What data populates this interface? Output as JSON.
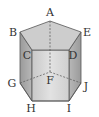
{
  "figure": {
    "vertices": {
      "A": {
        "label": "A",
        "x": 50,
        "y": 21,
        "lx": 50,
        "ly": 16
      },
      "B": {
        "label": "B",
        "x": 20,
        "y": 32,
        "lx": 13,
        "ly": 36
      },
      "C": {
        "label": "C",
        "x": 32,
        "y": 50,
        "lx": 26,
        "ly": 59
      },
      "D": {
        "label": "D",
        "x": 69,
        "y": 50,
        "lx": 73,
        "ly": 59
      },
      "E": {
        "label": "E",
        "x": 81,
        "y": 32,
        "lx": 87,
        "ly": 36
      },
      "F": {
        "label": "F",
        "x": 50,
        "y": 72,
        "lx": 50,
        "ly": 84
      },
      "G": {
        "label": "G",
        "x": 20,
        "y": 83,
        "lx": 12,
        "ly": 87
      },
      "H": {
        "label": "H",
        "x": 32,
        "y": 101,
        "lx": 31,
        "ly": 112
      },
      "I": {
        "label": "I",
        "x": 69,
        "y": 101,
        "lx": 69,
        "ly": 112
      },
      "J": {
        "label": "J",
        "x": 81,
        "y": 83,
        "lx": 86,
        "ly": 90
      }
    },
    "colors": {
      "top_face": "#cfcfcf",
      "front_face": "#d8d8d8",
      "side_face": "#a9a9a9",
      "edge": "#555555",
      "hidden_edge": "#555555"
    }
  }
}
